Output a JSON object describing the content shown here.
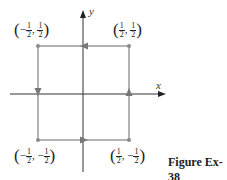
{
  "figure": {
    "caption": "Figure Ex-38",
    "axes": {
      "x_label": "x",
      "y_label": "y"
    },
    "colors": {
      "path": "#8a8a8a",
      "axis": "#333333",
      "text": "#222222"
    },
    "corners": [
      {
        "id": "top-left",
        "sign_x": "−",
        "x_num": "1",
        "x_den": "2",
        "sign_y": "",
        "y_num": "1",
        "y_den": "2"
      },
      {
        "id": "top-right",
        "sign_x": "",
        "x_num": "1",
        "x_den": "2",
        "sign_y": "",
        "y_num": "1",
        "y_den": "2"
      },
      {
        "id": "bottom-left",
        "sign_x": "−",
        "x_num": "1",
        "x_den": "2",
        "sign_y": "−",
        "y_num": "1",
        "y_den": "2"
      },
      {
        "id": "bottom-right",
        "sign_x": "",
        "x_num": "1",
        "x_den": "2",
        "sign_y": "−",
        "y_num": "1",
        "y_den": "2"
      }
    ],
    "separator": ",",
    "open_paren": "(",
    "close_paren": ")",
    "path_direction": "counterclockwise"
  }
}
